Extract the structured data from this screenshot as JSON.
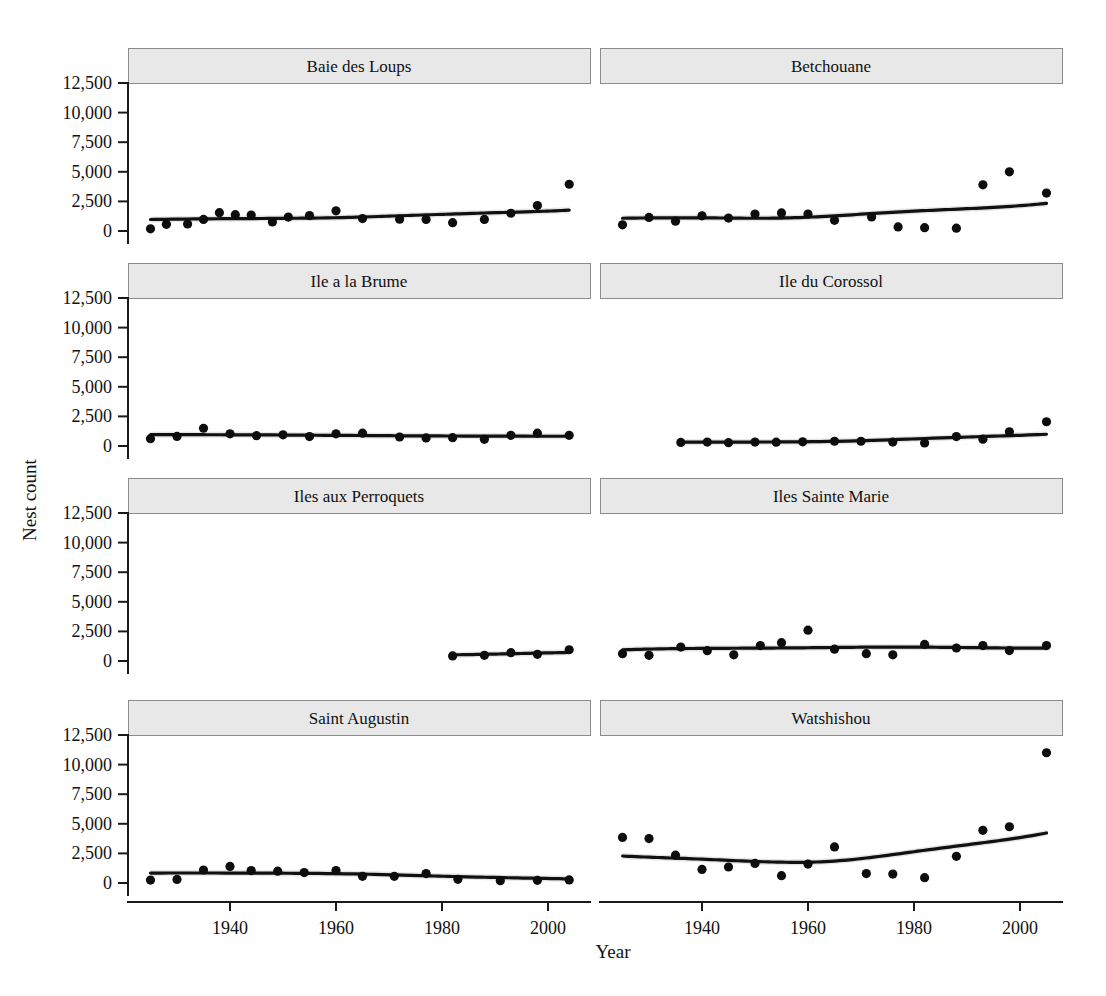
{
  "chart_data": {
    "type": "scatter",
    "title": "",
    "xlabel": "Year",
    "ylabel": "Nest count",
    "layout": {
      "facet_rows": 4,
      "facet_cols": 2,
      "grid": false,
      "legend": "none",
      "shared_x": true,
      "shared_y": true,
      "smoother": "loess-with-confidence-band"
    },
    "xlim": [
      1924,
      2007
    ],
    "ylim": [
      0,
      13200
    ],
    "xticks": [
      1940,
      1960,
      1980,
      2000
    ],
    "xtick_labels": [
      "1940",
      "1960",
      "1980",
      "2000"
    ],
    "yticks": [
      0,
      2500,
      5000,
      7500,
      10000,
      12500
    ],
    "ytick_labels": [
      "0",
      "2,500",
      "5,000",
      "7,500",
      "10,000",
      "12,500"
    ],
    "panels": [
      {
        "name": "Baie des Loups",
        "row": 0,
        "col": 0,
        "x": [
          1925,
          1928,
          1932,
          1935,
          1938,
          1941,
          1944,
          1948,
          1951,
          1955,
          1960,
          1965,
          1972,
          1977,
          1982,
          1988,
          1993,
          1998,
          2004
        ],
        "y": [
          180,
          560,
          600,
          980,
          1550,
          1380,
          1350,
          760,
          1180,
          1300,
          1700,
          1050,
          1000,
          980,
          700,
          980,
          1500,
          2150,
          3950
        ]
      },
      {
        "name": "Betchouane",
        "row": 0,
        "col": 1,
        "x": [
          1925,
          1930,
          1935,
          1940,
          1945,
          1950,
          1955,
          1960,
          1965,
          1972,
          1977,
          1982,
          1988,
          1993,
          1998,
          2005
        ],
        "y": [
          520,
          1150,
          830,
          1280,
          1090,
          1430,
          1530,
          1430,
          900,
          1190,
          340,
          280,
          240,
          3900,
          5000,
          3200
        ]
      },
      {
        "name": "Ile a la Brume",
        "row": 1,
        "col": 0,
        "x": [
          1925,
          1930,
          1935,
          1940,
          1945,
          1950,
          1955,
          1960,
          1965,
          1972,
          1977,
          1982,
          1988,
          1993,
          1998,
          2004
        ],
        "y": [
          620,
          810,
          1500,
          1030,
          870,
          940,
          800,
          1030,
          1080,
          760,
          680,
          700,
          560,
          900,
          1080,
          900,
          1200
        ]
      },
      {
        "name": "Ile du Corossol",
        "row": 1,
        "col": 1,
        "x": [
          1936,
          1941,
          1945,
          1950,
          1954,
          1959,
          1965,
          1970,
          1976,
          1982,
          1988,
          1993,
          1998,
          2005
        ],
        "y": [
          300,
          330,
          280,
          330,
          320,
          350,
          400,
          400,
          330,
          260,
          800,
          580,
          1200,
          2050
        ]
      },
      {
        "name": "Iles aux Perroquets",
        "row": 2,
        "col": 0,
        "x": [
          1982,
          1988,
          1993,
          1998,
          2004
        ],
        "y": [
          430,
          480,
          700,
          560,
          950
        ]
      },
      {
        "name": "Iles Sainte Marie",
        "row": 2,
        "col": 1,
        "x": [
          1925,
          1930,
          1936,
          1941,
          1946,
          1951,
          1955,
          1960,
          1965,
          1971,
          1976,
          1982,
          1988,
          1993,
          1998,
          2005
        ],
        "y": [
          620,
          480,
          1180,
          870,
          520,
          1300,
          1550,
          2600,
          1000,
          620,
          520,
          1400,
          1100,
          1300,
          880,
          1300
        ]
      },
      {
        "name": "Saint Augustin",
        "row": 3,
        "col": 0,
        "x": [
          1925,
          1930,
          1935,
          1940,
          1944,
          1949,
          1954,
          1960,
          1965,
          1971,
          1977,
          1983,
          1991,
          1998,
          2004
        ],
        "y": [
          250,
          300,
          1100,
          1400,
          1050,
          1000,
          880,
          1050,
          560,
          560,
          800,
          310,
          200,
          230,
          260
        ]
      },
      {
        "name": "Watshishou",
        "row": 3,
        "col": 1,
        "x": [
          1925,
          1930,
          1935,
          1940,
          1945,
          1950,
          1955,
          1960,
          1965,
          1971,
          1976,
          1982,
          1988,
          1993,
          1998,
          2005
        ],
        "y": [
          3850,
          3750,
          2350,
          1150,
          1350,
          1650,
          620,
          1600,
          3050,
          800,
          750,
          450,
          2250,
          4450,
          4750,
          11000
        ]
      }
    ]
  },
  "panel_titles": [
    "Baie des Loups",
    "Betchouane",
    "Ile a la Brume",
    "Ile du Corossol",
    "Iles aux Perroquets",
    "Iles Sainte Marie",
    "Saint Augustin",
    "Watshishou"
  ],
  "colors": {
    "point": "#0d0d0d",
    "line": "#111111",
    "band": "#b5b5b5",
    "strip_fill": "#e8e8e8",
    "strip_border": "#8c8c8c",
    "axis": "#1a1a1a",
    "background": "#ffffff"
  }
}
